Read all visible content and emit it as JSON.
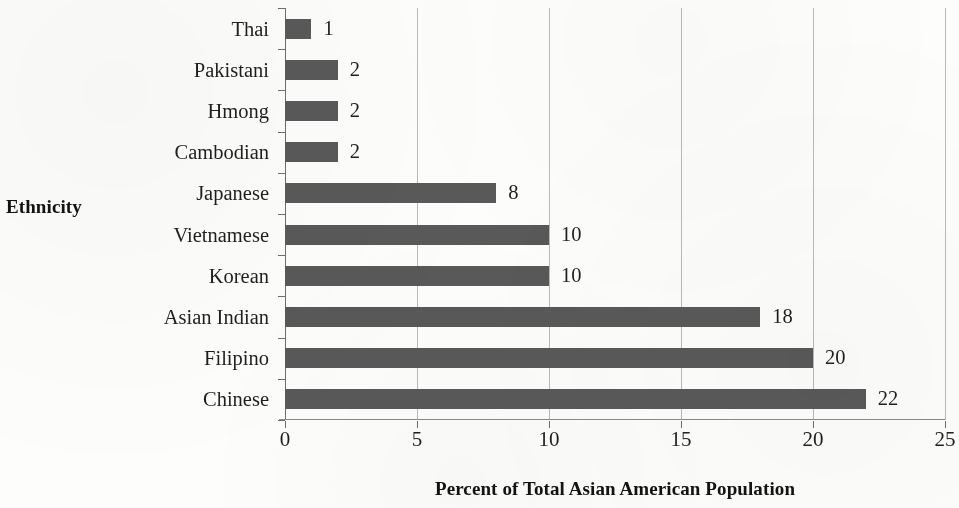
{
  "chart_data": {
    "type": "bar",
    "orientation": "horizontal",
    "title": "",
    "xlabel": "Percent of Total Asian American Population",
    "ylabel": "Ethnicity",
    "categories": [
      "Thai",
      "Pakistani",
      "Hmong",
      "Cambodian",
      "Japanese",
      "Vietnamese",
      "Korean",
      "Asian Indian",
      "Filipino",
      "Chinese"
    ],
    "values": [
      1,
      2,
      2,
      2,
      8,
      10,
      10,
      18,
      20,
      22
    ],
    "value_labels": [
      "1",
      "2",
      "2",
      "2",
      "8",
      "10",
      "10",
      "18",
      "20",
      "22"
    ],
    "xlim": [
      0,
      25
    ],
    "xticks": [
      0,
      5,
      10,
      15,
      20,
      25
    ],
    "xtick_labels": [
      "0",
      "5",
      "10",
      "15",
      "20",
      "25"
    ],
    "grid": "vertical",
    "legend": "none",
    "series": [
      {
        "name": "Percent of Total Asian American Population",
        "color": "#595959",
        "values": [
          1,
          2,
          2,
          2,
          8,
          10,
          10,
          18,
          20,
          22
        ]
      }
    ],
    "bar_color": "#595959",
    "gridline_color": "#b9b9b9",
    "axis_color": "#6e6e6e",
    "background_color": "#fdfdfb"
  }
}
